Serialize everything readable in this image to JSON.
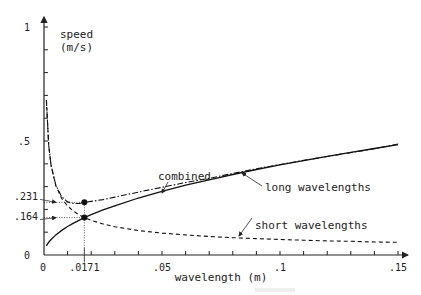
{
  "chart_data": {
    "type": "line",
    "title": "",
    "xlabel": "wavelength (m)",
    "ylabel": "speed\n(m/s)",
    "ylabel_lines": [
      "speed",
      "(m/s)"
    ],
    "xlim": [
      0,
      0.15
    ],
    "ylim": [
      0,
      1
    ],
    "x_ticks": [
      {
        "value": 0,
        "label": "0"
      },
      {
        "value": 0.05,
        "label": ".05"
      },
      {
        "value": 0.1,
        "label": ".1"
      },
      {
        "value": 0.15,
        "label": ".15"
      }
    ],
    "x_minor_step": 0.01,
    "y_ticks": [
      {
        "value": 0,
        "label": "0"
      },
      {
        "value": 0.5,
        "label": ".5"
      },
      {
        "value": 1,
        "label": "1"
      }
    ],
    "y_minor_step": 0.1,
    "grid": false,
    "series": [
      {
        "name": "combined",
        "style": "dash-dot",
        "x": [
          0.001,
          0.002,
          0.003,
          0.005,
          0.0075,
          0.01,
          0.0125,
          0.015,
          0.0171,
          0.02,
          0.025,
          0.03,
          0.04,
          0.05,
          0.06,
          0.07,
          0.08,
          0.09,
          0.1,
          0.11,
          0.12,
          0.13,
          0.14,
          0.15
        ],
        "values": [
          0.68,
          0.481,
          0.393,
          0.307,
          0.255,
          0.233,
          0.226,
          0.226,
          0.231,
          0.235,
          0.243,
          0.254,
          0.276,
          0.297,
          0.318,
          0.336,
          0.358,
          0.378,
          0.397,
          0.415,
          0.432,
          0.449,
          0.466,
          0.487
        ]
      },
      {
        "name": "long wavelengths",
        "style": "solid",
        "x": [
          0.001,
          0.002,
          0.003,
          0.005,
          0.0075,
          0.01,
          0.0125,
          0.015,
          0.0171,
          0.02,
          0.025,
          0.03,
          0.04,
          0.05,
          0.06,
          0.07,
          0.08,
          0.09,
          0.1,
          0.11,
          0.12,
          0.13,
          0.14,
          0.15
        ],
        "values": [
          0.04,
          0.056,
          0.068,
          0.088,
          0.108,
          0.125,
          0.14,
          0.153,
          0.164,
          0.177,
          0.198,
          0.216,
          0.25,
          0.279,
          0.306,
          0.33,
          0.353,
          0.375,
          0.395,
          0.414,
          0.433,
          0.45,
          0.467,
          0.484
        ]
      },
      {
        "name": "short wavelengths",
        "style": "dashed",
        "x": [
          0.001,
          0.002,
          0.003,
          0.005,
          0.0075,
          0.01,
          0.0125,
          0.015,
          0.0171,
          0.02,
          0.025,
          0.03,
          0.04,
          0.05,
          0.06,
          0.07,
          0.08,
          0.09,
          0.1,
          0.11,
          0.12,
          0.13,
          0.14,
          0.15
        ],
        "values": [
          0.68,
          0.481,
          0.392,
          0.304,
          0.248,
          0.215,
          0.192,
          0.175,
          0.164,
          0.152,
          0.136,
          0.124,
          0.107,
          0.096,
          0.088,
          0.081,
          0.076,
          0.072,
          0.068,
          0.065,
          0.062,
          0.06,
          0.057,
          0.0555
        ]
      }
    ],
    "crossover": {
      "x": 0.0171,
      "x_label": ".0171",
      "y_combined": 0.231,
      "y_combined_label": ".231",
      "y_component": 0.164,
      "y_component_label": ".164"
    },
    "annotations": [
      {
        "text": "combined",
        "target_series": "combined",
        "target_x": 0.075
      },
      {
        "text": "long wavelengths",
        "target_series": "long wavelengths",
        "target_x": 0.095
      },
      {
        "text": "short wavelengths",
        "target_series": "short wavelengths",
        "target_x": 0.07
      }
    ],
    "legend": "none"
  }
}
